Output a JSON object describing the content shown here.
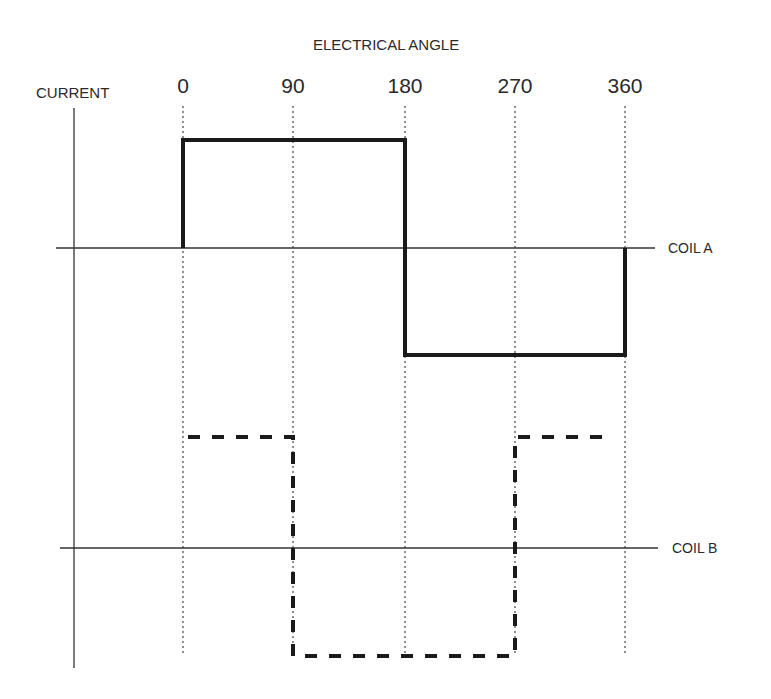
{
  "title": "ELECTRICAL ANGLE",
  "y_axis_label": "CURRENT",
  "angle_ticks": [
    "0",
    "90",
    "180",
    "270",
    "360"
  ],
  "traces": [
    {
      "name": "COIL A",
      "style": "solid",
      "color": "#1a1a1a",
      "segments": [
        {
          "from": 0,
          "to": 180,
          "level": "+"
        },
        {
          "from": 180,
          "to": 360,
          "level": "-"
        }
      ]
    },
    {
      "name": "COIL B",
      "style": "dashed",
      "color": "#1a1a1a",
      "segments": [
        {
          "from": 0,
          "to": 90,
          "level": "+"
        },
        {
          "from": 90,
          "to": 270,
          "level": "-"
        },
        {
          "from": 270,
          "to": 360,
          "level": "+"
        }
      ]
    }
  ],
  "labels": {
    "coil_a": "COIL A",
    "coil_b": "COIL B"
  }
}
